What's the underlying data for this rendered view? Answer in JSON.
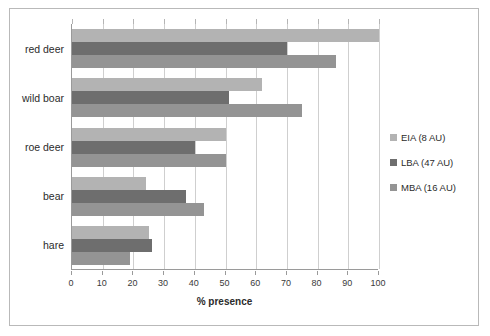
{
  "chart_data": {
    "type": "bar",
    "orientation": "horizontal",
    "title": "",
    "xlabel": "% presence",
    "ylabel": "",
    "xlim": [
      0,
      100
    ],
    "xticks": [
      0,
      10,
      20,
      30,
      40,
      50,
      60,
      70,
      80,
      90,
      100
    ],
    "grid": true,
    "legend_position": "right",
    "categories": [
      "red deer",
      "wild boar",
      "roe deer",
      "bear",
      "hare"
    ],
    "series": [
      {
        "name": "EIA (8 AU)",
        "color": "#b3b3b3",
        "values": [
          100,
          62,
          50,
          24,
          25
        ]
      },
      {
        "name": "LBA (47 AU)",
        "color": "#6e6e6e",
        "values": [
          70,
          51,
          40,
          37,
          26
        ]
      },
      {
        "name": "MBA (16 AU)",
        "color": "#949494",
        "values": [
          86,
          75,
          50,
          43,
          19
        ]
      }
    ]
  },
  "legend": {
    "items": [
      {
        "label": "EIA (8 AU)",
        "color": "#b3b3b3"
      },
      {
        "label": "LBA (47 AU)",
        "color": "#6e6e6e"
      },
      {
        "label": "MBA (16 AU)",
        "color": "#949494"
      }
    ]
  },
  "axis": {
    "x_title": "% presence",
    "x_tick_labels": [
      "0",
      "10",
      "20",
      "30",
      "40",
      "50",
      "60",
      "70",
      "80",
      "90",
      "100"
    ],
    "y_tick_labels": [
      "red deer",
      "wild boar",
      "roe deer",
      "bear",
      "hare"
    ]
  }
}
